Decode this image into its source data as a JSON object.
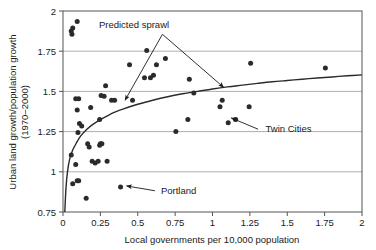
{
  "chart_data": {
    "type": "scatter",
    "title": "",
    "xlabel": "Local governments per 10,000 population",
    "ylabel": "Urban land growth/population growth (1970–2000)",
    "ylabel_line1": "Urban land growth/population growth",
    "ylabel_line2": "(1970–2000)",
    "xlim": [
      0,
      2
    ],
    "ylim": [
      0.75,
      2
    ],
    "xticks": [
      "0",
      "0.25",
      "0.5",
      "0.75",
      "1",
      "1.25",
      "1.5",
      "1.75",
      "2"
    ],
    "xtick_values": [
      0,
      0.25,
      0.5,
      0.75,
      1,
      1.25,
      1.5,
      1.75,
      2
    ],
    "yticks": [
      "0.75",
      "1",
      "1.25",
      "1.5",
      "1.75",
      "2"
    ],
    "ytick_values": [
      0.75,
      1,
      1.25,
      1.5,
      1.75,
      2
    ],
    "grid": "horizontal",
    "grid_values": [
      1,
      1.25,
      1.5,
      1.75
    ],
    "legend": "none",
    "marker_color": "#2b2b2b",
    "line_color": "#2b2b2b",
    "grid_color": "#aeaeae",
    "axis_color": "#555555",
    "points": [
      [
        0.055,
        1.875
      ],
      [
        0.06,
        1.855
      ],
      [
        0.065,
        1.895
      ],
      [
        0.095,
        1.935
      ],
      [
        0.085,
        1.455
      ],
      [
        0.105,
        1.455
      ],
      [
        0.095,
        1.385
      ],
      [
        0.1,
        1.245
      ],
      [
        0.11,
        1.3
      ],
      [
        0.125,
        1.285
      ],
      [
        0.055,
        1.105
      ],
      [
        0.085,
        1.045
      ],
      [
        0.065,
        0.925
      ],
      [
        0.095,
        0.945
      ],
      [
        0.105,
        0.945
      ],
      [
        0.155,
        0.835
      ],
      [
        0.165,
        1.175
      ],
      [
        0.175,
        1.155
      ],
      [
        0.185,
        1.4
      ],
      [
        0.195,
        1.065
      ],
      [
        0.215,
        1.055
      ],
      [
        0.235,
        1.065
      ],
      [
        0.245,
        1.165
      ],
      [
        0.25,
        1.175
      ],
      [
        0.26,
        1.175
      ],
      [
        0.245,
        1.325
      ],
      [
        0.255,
        1.475
      ],
      [
        0.275,
        1.47
      ],
      [
        0.285,
        1.535
      ],
      [
        0.295,
        1.065
      ],
      [
        0.325,
        1.445
      ],
      [
        0.345,
        1.445
      ],
      [
        0.385,
        0.905
      ],
      [
        0.445,
        1.665
      ],
      [
        0.465,
        1.445
      ],
      [
        0.545,
        1.585
      ],
      [
        0.56,
        1.755
      ],
      [
        0.585,
        1.585
      ],
      [
        0.605,
        1.6
      ],
      [
        0.625,
        1.665
      ],
      [
        0.685,
        1.705
      ],
      [
        0.755,
        1.25
      ],
      [
        0.835,
        1.325
      ],
      [
        0.845,
        1.575
      ],
      [
        0.875,
        1.49
      ],
      [
        1.05,
        1.405
      ],
      [
        1.065,
        1.445
      ],
      [
        1.105,
        1.305
      ],
      [
        1.155,
        1.325
      ],
      [
        1.245,
        1.405
      ],
      [
        1.255,
        1.675
      ],
      [
        1.755,
        1.645
      ]
    ],
    "fitted_curve": {
      "name": "Predicted sprawl",
      "description": "logarithmic fit curve through scatter",
      "points": [
        [
          0.012,
          0.75
        ],
        [
          0.02,
          0.9
        ],
        [
          0.03,
          1.0
        ],
        [
          0.045,
          1.08
        ],
        [
          0.065,
          1.135
        ],
        [
          0.09,
          1.18
        ],
        [
          0.12,
          1.225
        ],
        [
          0.16,
          1.265
        ],
        [
          0.2,
          1.295
        ],
        [
          0.25,
          1.325
        ],
        [
          0.3,
          1.35
        ],
        [
          0.35,
          1.372
        ],
        [
          0.4,
          1.39
        ],
        [
          0.5,
          1.42
        ],
        [
          0.6,
          1.445
        ],
        [
          0.7,
          1.467
        ],
        [
          0.8,
          1.485
        ],
        [
          0.9,
          1.5
        ],
        [
          1.0,
          1.515
        ],
        [
          1.1,
          1.528
        ],
        [
          1.2,
          1.539
        ],
        [
          1.3,
          1.55
        ],
        [
          1.4,
          1.56
        ],
        [
          1.5,
          1.568
        ],
        [
          1.6,
          1.576
        ],
        [
          1.7,
          1.583
        ],
        [
          1.8,
          1.59
        ],
        [
          1.9,
          1.597
        ],
        [
          2.0,
          1.603
        ]
      ]
    },
    "annotations": [
      {
        "id": "predicted-sprawl",
        "label": "Predicted sprawl",
        "label_x": 0.475,
        "label_y": 1.895,
        "arrows": [
          {
            "from": [
              0.665,
              1.855
            ],
            "to": [
              0.415,
              1.445
            ]
          },
          {
            "from": [
              0.665,
              1.855
            ],
            "to": [
              1.075,
              1.525
            ]
          }
        ]
      },
      {
        "id": "twin-cities",
        "label": "Twin Cities",
        "label_x": 1.355,
        "label_y": 1.245,
        "arrows": [
          {
            "from": [
              1.305,
              1.265
            ],
            "to": [
              1.125,
              1.335
            ]
          }
        ]
      },
      {
        "id": "portland",
        "label": "Portland",
        "label_x": 0.655,
        "label_y": 0.865,
        "arrows": [
          {
            "from": [
              0.615,
              0.882
            ],
            "to": [
              0.425,
              0.912
            ]
          }
        ]
      }
    ]
  }
}
